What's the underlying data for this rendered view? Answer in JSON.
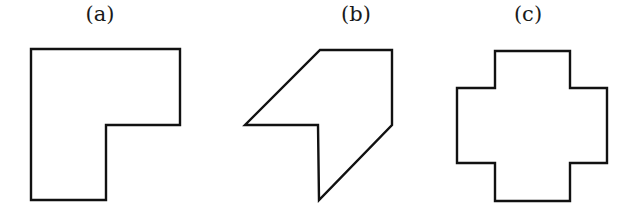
{
  "figure": {
    "shapes": [
      {
        "label": "(a)",
        "label_x": 100,
        "description": "L-shaped polygon",
        "points": "31,49 180,49 180,125 106,125 106,200 31,200"
      },
      {
        "label": "(b)",
        "label_x": 356,
        "description": "sheared arrow-like polygon",
        "points": "320,50 392,50 392,125 319,200 318,125 245,125"
      },
      {
        "label": "(c)",
        "label_x": 528,
        "description": "plus/cross-shaped polygon",
        "points": "495,51 570,51 570,88 607,88 607,163 570,163 570,201 495,201 495,163 457,163 457,88 495,88"
      }
    ],
    "stroke_color": "#111111",
    "fill_color": "#ffffff"
  }
}
